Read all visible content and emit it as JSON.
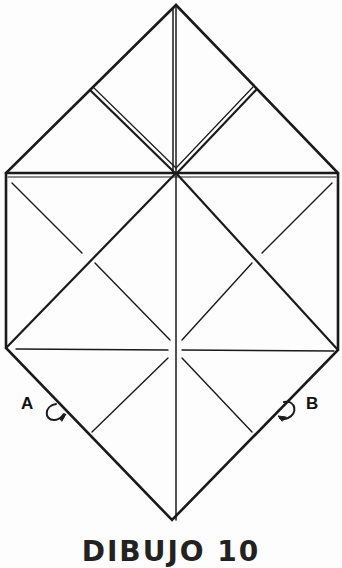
{
  "diagram": {
    "type": "origami-fold-diagram",
    "labels": {
      "a": "A",
      "b": "B"
    },
    "caption": "DIBUJO 10",
    "colors": {
      "line": "#1a1a1a",
      "background": "#fdfdfd"
    }
  }
}
